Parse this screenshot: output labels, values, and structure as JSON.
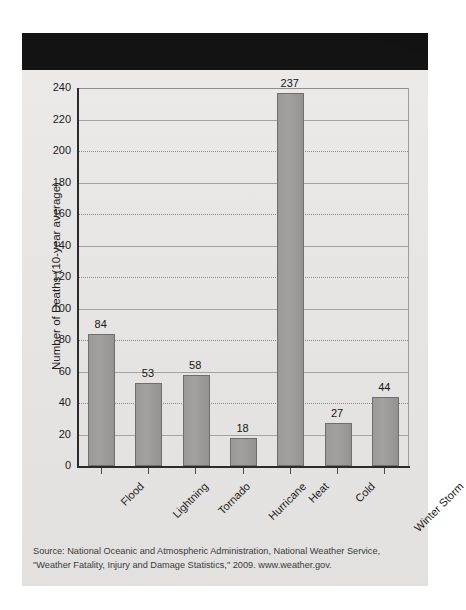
{
  "banner": {
    "title": "WEATHER FATALITIES"
  },
  "source": {
    "line1": "Source: National Oceanic and Atmospheric Administration, National Weather Service,",
    "line2": "\"Weather Fatality, Injury and Damage Statistics,\" 2009. www.weather.gov."
  },
  "colors": {
    "banner_bg": "#121212",
    "banner_text": "#ffffff",
    "card_bg": "#e9e7e6",
    "bar_fill": "#9b9a99",
    "bar_stroke": "#6f6e6d",
    "axis": "#2b2b2b",
    "gridline": "#8e8c8b",
    "text": "#1b1b1b"
  },
  "chart_data": {
    "type": "bar",
    "title": "WEATHER FATALITIES",
    "categories": [
      "Flood",
      "Lightning",
      "Tornado",
      "Hurricane",
      "Heat",
      "Cold",
      "Winter Storm"
    ],
    "values": [
      84,
      53,
      58,
      18,
      237,
      27,
      44
    ],
    "xlabel": "",
    "ylabel": "Number of Deaths (10-year average)",
    "ylim": [
      0,
      240
    ],
    "ytick_step": 20,
    "yticks": [
      0,
      20,
      40,
      60,
      80,
      100,
      120,
      140,
      160,
      180,
      200,
      220,
      240
    ],
    "ytick_labels": [
      "0",
      "20",
      "40",
      "60",
      "80",
      "100",
      "120",
      "140",
      "160",
      "180",
      "200",
      "220",
      "240"
    ],
    "grid": true,
    "grid_axis": "y",
    "legend": false,
    "data_labels": [
      "84",
      "53",
      "58",
      "18",
      "237",
      "27",
      "44"
    ]
  }
}
